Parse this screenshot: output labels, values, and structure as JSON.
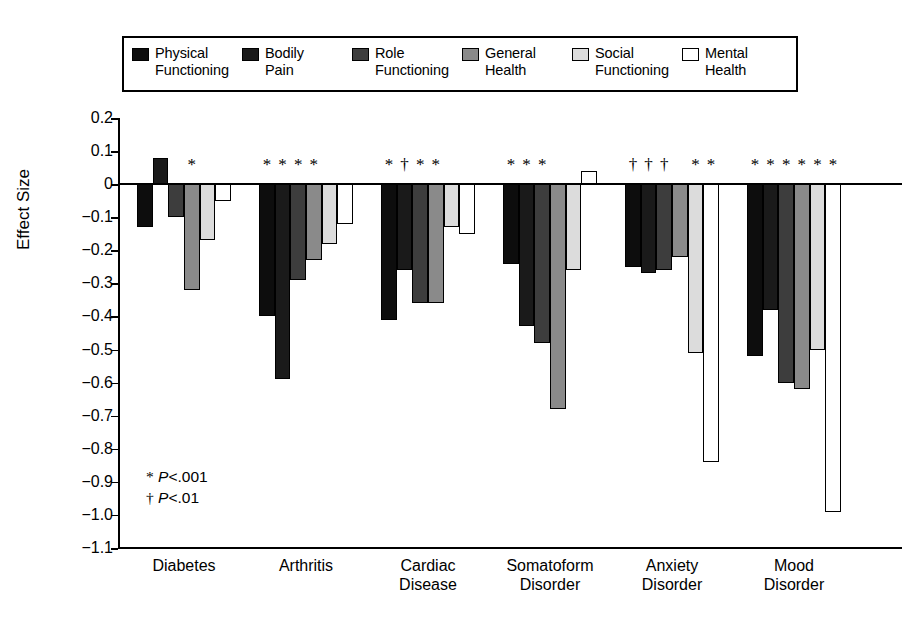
{
  "legend": {
    "entries": [
      {
        "label": "Physical\nFunctioning",
        "color": "#0d0d0d",
        "swatch_name": "legend-swatch-physical-functioning"
      },
      {
        "label": "Bodily\nPain",
        "color": "#1a1a1a",
        "swatch_name": "legend-swatch-bodily-pain"
      },
      {
        "label": "Role\nFunctioning",
        "color": "#3d3d3d",
        "swatch_name": "legend-swatch-role-functioning"
      },
      {
        "label": "General\nHealth",
        "color": "#8a8a8a",
        "swatch_name": "legend-swatch-general-health"
      },
      {
        "label": "Social\nFunctioning",
        "color": "#dcdcdc",
        "swatch_name": "legend-swatch-social-functioning"
      },
      {
        "label": "Mental\nHealth",
        "color": "#ffffff",
        "swatch_name": "legend-swatch-mental-health"
      }
    ]
  },
  "axis": {
    "ylabel": "Effect Size",
    "yticks": [
      "0.2",
      "0.1",
      "0",
      "−0.1",
      "−0.2",
      "−0.3",
      "−0.4",
      "−0.5",
      "−0.6",
      "−0.7",
      "−0.8",
      "−0.9",
      "−1.0",
      "−1.1"
    ],
    "ytick_values": [
      0.2,
      0.1,
      0,
      -0.1,
      -0.2,
      -0.3,
      -0.4,
      -0.5,
      -0.6,
      -0.7,
      -0.8,
      -0.9,
      -1.0,
      -1.1
    ]
  },
  "footnote": {
    "line1_mark": "*",
    "line1_p": "P",
    "line1_rest": "<.001",
    "line2_mark": "†",
    "line2_p": "P",
    "line2_rest": "<.01"
  },
  "significance": {
    "Diabetes": [
      "",
      "",
      "",
      "*",
      "",
      ""
    ],
    "Arthritis": [
      "*",
      "*",
      "*",
      "*",
      "",
      ""
    ],
    "Cardiac Disease": [
      "*",
      "†",
      "*",
      "*",
      "",
      ""
    ],
    "Somatoform Disorder": [
      "*",
      "*",
      "*",
      "",
      "",
      ""
    ],
    "Anxiety Disorder": [
      "†",
      "†",
      "†",
      "",
      "*",
      "*"
    ],
    "Mood Disorder": [
      "*",
      "*",
      "*",
      "*",
      "*",
      "*"
    ]
  },
  "chart_data": {
    "type": "bar",
    "title": "",
    "xlabel": "",
    "ylabel": "Effect Size",
    "ylim": [
      -1.1,
      0.2
    ],
    "grid": false,
    "legend_position": "top",
    "categories": [
      "Diabetes",
      "Arthritis",
      "Cardiac\nDisease",
      "Somatoform\nDisorder",
      "Anxiety\nDisorder",
      "Mood\nDisorder"
    ],
    "series": [
      {
        "name": "Physical Functioning",
        "color": "#0d0d0d",
        "values": [
          -0.13,
          -0.4,
          -0.41,
          -0.24,
          -0.25,
          -0.52
        ]
      },
      {
        "name": "Bodily Pain",
        "color": "#1a1a1a",
        "values": [
          0.08,
          -0.59,
          -0.26,
          -0.43,
          -0.27,
          -0.38
        ]
      },
      {
        "name": "Role Functioning",
        "color": "#3d3d3d",
        "values": [
          -0.1,
          -0.29,
          -0.36,
          -0.48,
          -0.26,
          -0.6
        ]
      },
      {
        "name": "General Health",
        "color": "#8a8a8a",
        "values": [
          -0.32,
          -0.23,
          -0.36,
          -0.68,
          -0.22,
          -0.62
        ]
      },
      {
        "name": "Social Functioning",
        "color": "#dcdcdc",
        "values": [
          -0.17,
          -0.18,
          -0.13,
          -0.26,
          -0.51,
          -0.5
        ]
      },
      {
        "name": "Mental Health",
        "color": "#ffffff",
        "values": [
          -0.05,
          -0.12,
          -0.15,
          0.04,
          -0.84,
          -0.99
        ]
      }
    ]
  }
}
